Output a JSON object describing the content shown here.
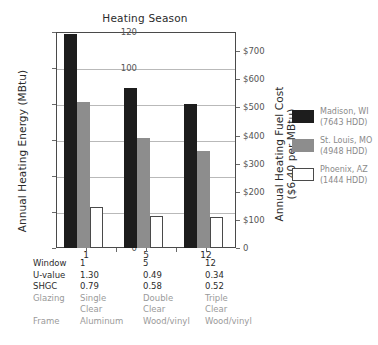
{
  "chart_data": {
    "type": "bar",
    "title": "Heating Season",
    "xlabel": "",
    "ylabel": "Annual Heating Energy (MBtu)",
    "ylabel_right": "Annual Heating Fuel Cost\n($6.40 per MBtu)",
    "ylabel_right_line1": "Annual Heating Fuel Cost",
    "ylabel_right_line2": "($6.40 per MBtu)",
    "categories": [
      "1",
      "5",
      "12"
    ],
    "ylim": [
      0,
      120
    ],
    "yticks": [
      0,
      20,
      40,
      60,
      80,
      100,
      120
    ],
    "ytick_labels": [
      "0",
      "20",
      "40",
      "60",
      "80",
      "100",
      "120"
    ],
    "ylim_right": [
      0,
      768
    ],
    "yticks_right": [
      0,
      100,
      200,
      300,
      400,
      500,
      600,
      700
    ],
    "ytick_labels_right": [
      "0",
      "$100",
      "$200",
      "$300",
      "$400",
      "$500",
      "$600",
      "$700"
    ],
    "fuel_price_per_mbtu": 6.4,
    "grid": true,
    "legend_position": "right",
    "series": [
      {
        "name": "Madison, WI",
        "sublabel": "(7643 HDD)",
        "hdd": 7643,
        "color": "#1d1d1d",
        "values": [
          119,
          89,
          80
        ]
      },
      {
        "name": "St. Louis, MO",
        "sublabel": "(4948 HDD)",
        "hdd": 4948,
        "color": "#8d8d8d",
        "values": [
          81,
          61,
          54
        ]
      },
      {
        "name": "Phoenix, AZ",
        "sublabel": "(1444 HDD)",
        "hdd": 1444,
        "color": "#ffffff",
        "values": [
          23,
          18,
          17
        ]
      }
    ]
  },
  "table": {
    "rows": [
      {
        "label": "Window",
        "values": [
          "1",
          "5",
          "12"
        ],
        "muted": false
      },
      {
        "label": "U-value",
        "values": [
          "1.30",
          "0.49",
          "0.34"
        ],
        "muted": false
      },
      {
        "label": "SHGC",
        "values": [
          "0.79",
          "0.58",
          "0.52"
        ],
        "muted": false
      },
      {
        "label": "Glazing",
        "values": [
          "Single",
          "Double",
          "Triple"
        ],
        "muted": true
      },
      {
        "label": "",
        "values": [
          "Clear",
          "Clear",
          "Clear"
        ],
        "muted": true
      },
      {
        "label": "Frame",
        "values": [
          "Aluminum",
          "Wood/vinyl",
          "Wood/vinyl"
        ],
        "muted": true
      }
    ]
  },
  "colors": {
    "madison": "#1d1d1d",
    "stlouis": "#8d8d8d",
    "phoenix": "#ffffff",
    "axis": "#4a4a4a",
    "grid": "#b9b9b9",
    "muted_text": "#9a9a9a"
  }
}
